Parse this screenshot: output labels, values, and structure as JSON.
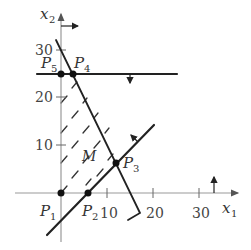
{
  "diagram": {
    "type": "linear-programming-feasible-region",
    "axes": {
      "x_label": "x",
      "x_label_sub": "1",
      "y_label": "x",
      "y_label_sub": "2",
      "x_ticks": [
        "10",
        "20",
        "30"
      ],
      "y_ticks": [
        "10",
        "20",
        "30"
      ]
    },
    "points": [
      {
        "name": "P",
        "sub": "1",
        "x": 0,
        "y": 0
      },
      {
        "name": "P",
        "sub": "2",
        "x": 6,
        "y": 0
      },
      {
        "name": "P",
        "sub": "3",
        "x": 12,
        "y": 6
      },
      {
        "name": "P",
        "sub": "4",
        "x": 2.5,
        "y": 25
      },
      {
        "name": "P",
        "sub": "5",
        "x": 0,
        "y": 25
      }
    ],
    "region_label": "M",
    "constraints": [
      {
        "description": "x2 <= 25 (horizontal line, arrow pointing down)"
      },
      {
        "description": "decreasing line through P4 and P3 (arrow pointing left/down)"
      },
      {
        "description": "increasing line through P2 and P3 (arrow pointing up-left)"
      },
      {
        "description": "x1 >= 0 (arrow on x2-axis pointing right)"
      },
      {
        "description": "x2 >= 0 (arrow on x1-axis pointing up)"
      }
    ],
    "colors": {
      "lines": "#222222",
      "axes": "#999999",
      "text": "#333333"
    }
  }
}
